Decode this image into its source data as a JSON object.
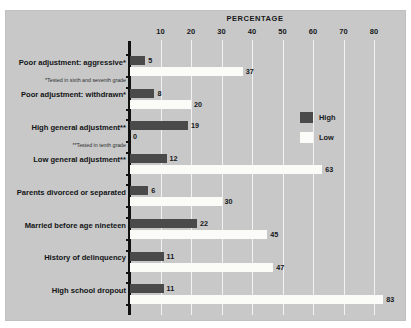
{
  "chart_data": {
    "type": "bar",
    "orientation": "horizontal",
    "title": "PERCENTAGE",
    "xlabel": "PERCENTAGE",
    "ylabel": "",
    "xlim": [
      0,
      85
    ],
    "grid": true,
    "legend_position": "inside-right",
    "ticks": [
      10,
      20,
      30,
      40,
      50,
      60,
      70,
      80
    ],
    "categories": [
      "Poor adjustment: aggressive*",
      "Poor adjustment: withdrawn*",
      "High general adjustment**",
      "Low general adjustment**",
      "Parents divorced or separated",
      "Married before age nineteen",
      "History of delinquency",
      "High school dropout"
    ],
    "series": [
      {
        "name": "High",
        "color": "#4a4a4a",
        "values": [
          5,
          8,
          19,
          12,
          6,
          22,
          11,
          11
        ]
      },
      {
        "name": "Low",
        "color": "#fbfbf8",
        "values": [
          37,
          20,
          0,
          63,
          30,
          45,
          47,
          83
        ]
      }
    ],
    "annotations": [
      "*Tested in sixth and seventh grade",
      "**Tested in tenth grade"
    ]
  },
  "legend": {
    "items": [
      {
        "label": "High",
        "swatch": "high"
      },
      {
        "label": "Low",
        "swatch": "low"
      }
    ]
  },
  "footnotes": {
    "one": "*Tested in sixth and seventh grade",
    "two": "**Tested in tenth grade"
  }
}
